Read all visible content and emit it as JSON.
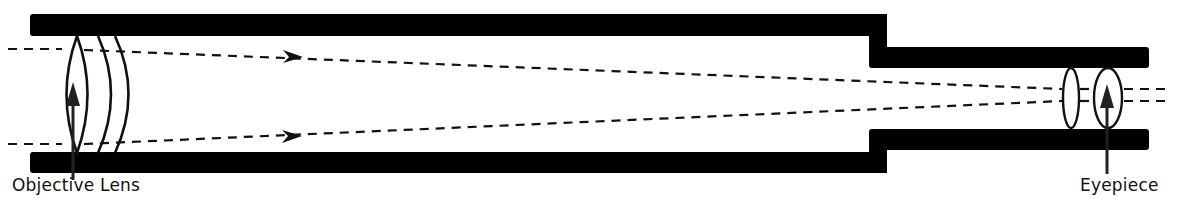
{
  "diagram": {
    "type": "refracting-telescope-schematic",
    "colors": {
      "tube": "#000000",
      "lens_stroke": "#111111",
      "ray": "#111111",
      "background": "#ffffff",
      "label": "#111111"
    },
    "labels": {
      "objective": "Objective Lens",
      "eyepiece": "Eyepiece"
    },
    "components": [
      {
        "id": "main-tube",
        "name": "Main tube"
      },
      {
        "id": "eyepiece-tube",
        "name": "Eyepiece tube"
      },
      {
        "id": "objective-lens",
        "name": "Objective Lens"
      },
      {
        "id": "eyepiece-lenses",
        "name": "Eyepiece"
      },
      {
        "id": "light-rays",
        "name": "Light rays (dashed, converging)"
      }
    ]
  }
}
